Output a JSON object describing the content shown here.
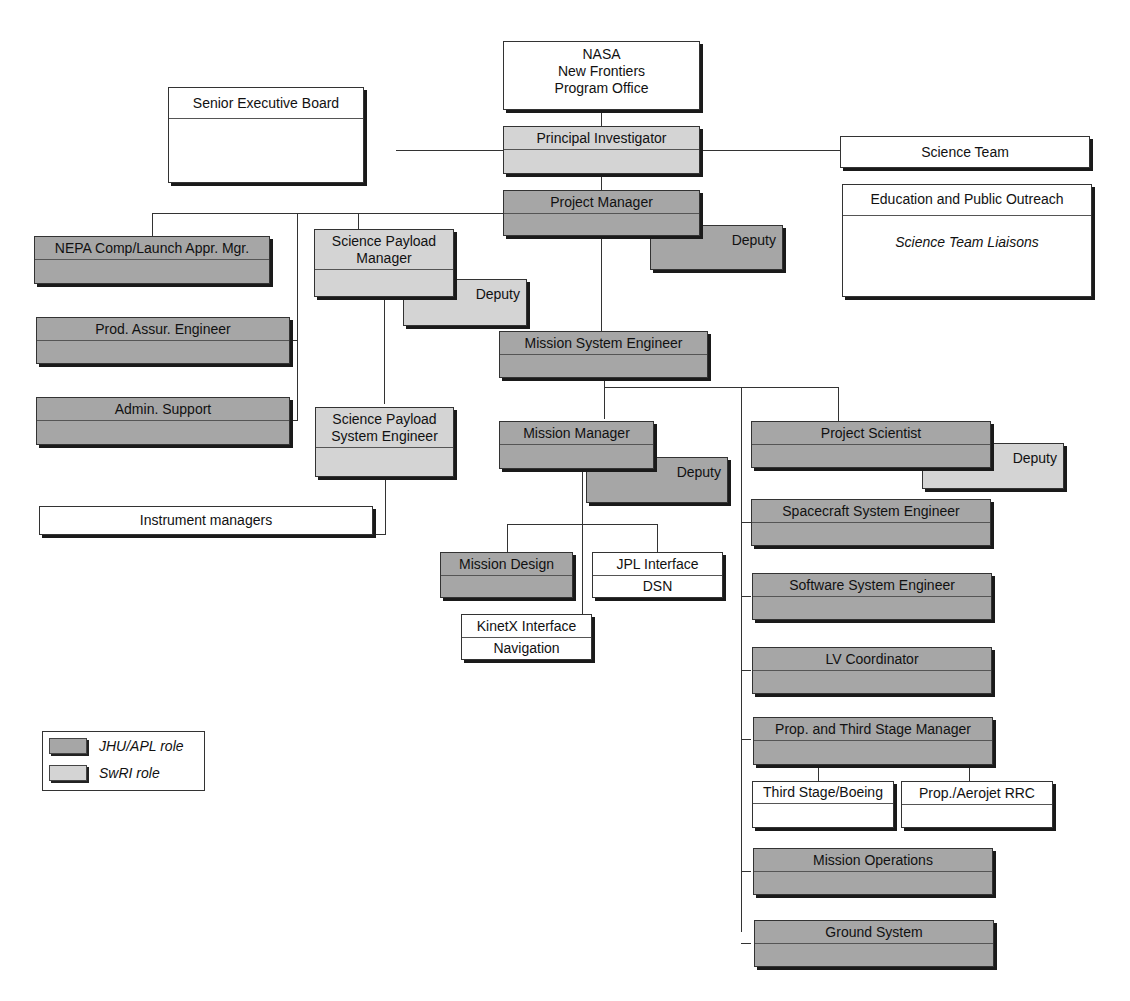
{
  "diagram": {
    "type": "organization-chart",
    "colors": {
      "jhu_apl": "#a6a6a6",
      "swri": "#d4d4d4",
      "external": "#ffffff"
    },
    "nodes": {
      "nasa": {
        "line1": "NASA",
        "line2": "New Frontiers",
        "line3": "Program Office"
      },
      "seb": {
        "label": "Senior Executive Board"
      },
      "pi": {
        "label": "Principal Investigator"
      },
      "science_team": {
        "label": "Science Team"
      },
      "epo": {
        "label": "Education and Public Outreach",
        "sub": "Science Team Liaisons"
      },
      "pm": {
        "label": "Project Manager",
        "deputy": "Deputy"
      },
      "nepa": {
        "label": "NEPA Comp/Launch Appr. Mgr."
      },
      "spm": {
        "line1": "Science Payload",
        "line2": "Manager",
        "deputy": "Deputy"
      },
      "pae": {
        "label": "Prod. Assur. Engineer"
      },
      "admin": {
        "label": "Admin. Support"
      },
      "spse": {
        "line1": "Science Payload",
        "line2": "System Engineer"
      },
      "instr": {
        "label": "Instrument managers"
      },
      "mse": {
        "label": "Mission System Engineer"
      },
      "mm": {
        "label": "Mission Manager",
        "deputy": "Deputy"
      },
      "md": {
        "label": "Mission Design"
      },
      "jpl": {
        "label": "JPL Interface",
        "sub": "DSN"
      },
      "kinetx": {
        "label": "KinetX Interface",
        "sub": "Navigation"
      },
      "ps": {
        "label": "Project Scientist",
        "deputy": "Deputy"
      },
      "sse": {
        "label": "Spacecraft System Engineer"
      },
      "swse": {
        "label": "Software System Engineer"
      },
      "lv": {
        "label": "LV Coordinator"
      },
      "prop": {
        "label": "Prop. and Third Stage Manager"
      },
      "boeing": {
        "label": "Third Stage/Boeing"
      },
      "aerojet": {
        "label": "Prop./Aerojet RRC"
      },
      "mops": {
        "label": "Mission Operations"
      },
      "gs": {
        "label": "Ground System"
      }
    },
    "legend": [
      {
        "label": "JHU/APL role",
        "color": "#a6a6a6"
      },
      {
        "label": "SwRI role",
        "color": "#d4d4d4"
      }
    ]
  }
}
